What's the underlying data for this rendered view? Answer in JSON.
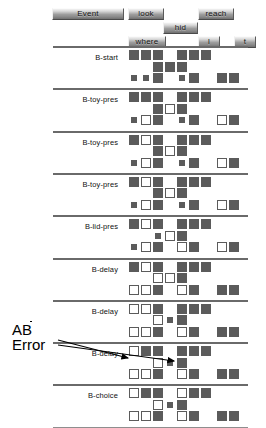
{
  "toolbar": {
    "buttons": [
      {
        "label": "Event",
        "x": 52,
        "y": 8,
        "w": 72,
        "h": 12
      },
      {
        "label": "look",
        "x": 128,
        "y": 8,
        "w": 36,
        "h": 12
      },
      {
        "label": "reach",
        "x": 198,
        "y": 8,
        "w": 36,
        "h": 12
      },
      {
        "label": "hid",
        "x": 163,
        "y": 22,
        "w": 35,
        "h": 12
      },
      {
        "label": "where",
        "x": 128,
        "y": 36,
        "w": 38,
        "h": 12
      },
      {
        "label": "l",
        "x": 198,
        "y": 36,
        "w": 22,
        "h": 12
      },
      {
        "label": "t",
        "x": 234,
        "y": 36,
        "w": 22,
        "h": 12
      }
    ]
  },
  "annotation": {
    "line1_prefix": "A",
    "line1_overbar": "B",
    "line2": "Error"
  },
  "chart_data": {
    "type": "heatmap",
    "title": "",
    "xlabel": "",
    "ylabel": "",
    "legend": [
      "filled = dark square",
      "open = white square",
      "dot = white dot in dark square"
    ],
    "columns": 10,
    "cell_states": [
      "filled",
      "open",
      "dot",
      "empty"
    ],
    "blocks": [
      {
        "label": "B-start",
        "rows": [
          {
            "y": 0,
            "cells": [
              {
                "c": 0,
                "s": "filled"
              },
              {
                "c": 1,
                "s": "filled"
              },
              {
                "c": 2,
                "s": "filled"
              },
              {
                "c": 4,
                "s": "filled"
              },
              {
                "c": 5,
                "s": "filled"
              },
              {
                "c": 6,
                "s": "filled"
              }
            ]
          },
          {
            "y": 1,
            "cells": [
              {
                "c": 2,
                "s": "filled"
              },
              {
                "c": 3,
                "s": "filled"
              },
              {
                "c": 4,
                "s": "filled"
              }
            ]
          },
          {
            "y": 2,
            "cells": [
              {
                "c": 0,
                "s": "dot"
              },
              {
                "c": 1,
                "s": "dot"
              },
              {
                "c": 2,
                "s": "filled"
              },
              {
                "c": 4,
                "s": "dot"
              },
              {
                "c": 5,
                "s": "filled"
              },
              {
                "c": 7,
                "s": "filled"
              },
              {
                "c": 8,
                "s": "filled"
              }
            ]
          }
        ]
      },
      {
        "label": "B-toy-pres",
        "rows": [
          {
            "y": 0,
            "cells": [
              {
                "c": 0,
                "s": "filled"
              },
              {
                "c": 1,
                "s": "filled"
              },
              {
                "c": 2,
                "s": "filled"
              },
              {
                "c": 4,
                "s": "filled"
              },
              {
                "c": 5,
                "s": "filled"
              },
              {
                "c": 6,
                "s": "filled"
              }
            ]
          },
          {
            "y": 1,
            "cells": [
              {
                "c": 2,
                "s": "filled"
              },
              {
                "c": 3,
                "s": "open"
              },
              {
                "c": 4,
                "s": "filled"
              }
            ]
          },
          {
            "y": 2,
            "cells": [
              {
                "c": 0,
                "s": "dot"
              },
              {
                "c": 1,
                "s": "open"
              },
              {
                "c": 2,
                "s": "filled"
              },
              {
                "c": 4,
                "s": "dot"
              },
              {
                "c": 5,
                "s": "filled"
              },
              {
                "c": 7,
                "s": "open"
              },
              {
                "c": 8,
                "s": "filled"
              }
            ]
          }
        ]
      },
      {
        "label": "B-toy-pres",
        "rows": [
          {
            "y": 0,
            "cells": [
              {
                "c": 0,
                "s": "filled"
              },
              {
                "c": 1,
                "s": "open"
              },
              {
                "c": 2,
                "s": "filled"
              },
              {
                "c": 4,
                "s": "filled"
              },
              {
                "c": 5,
                "s": "filled"
              },
              {
                "c": 6,
                "s": "filled"
              }
            ]
          },
          {
            "y": 1,
            "cells": [
              {
                "c": 2,
                "s": "filled"
              },
              {
                "c": 3,
                "s": "open"
              },
              {
                "c": 4,
                "s": "filled"
              }
            ]
          },
          {
            "y": 2,
            "cells": [
              {
                "c": 0,
                "s": "dot"
              },
              {
                "c": 1,
                "s": "open"
              },
              {
                "c": 2,
                "s": "filled"
              },
              {
                "c": 4,
                "s": "dot"
              },
              {
                "c": 5,
                "s": "filled"
              },
              {
                "c": 7,
                "s": "open"
              },
              {
                "c": 8,
                "s": "filled"
              }
            ]
          }
        ]
      },
      {
        "label": "B-toy-pres",
        "rows": [
          {
            "y": 0,
            "cells": [
              {
                "c": 0,
                "s": "filled"
              },
              {
                "c": 1,
                "s": "open"
              },
              {
                "c": 2,
                "s": "filled"
              },
              {
                "c": 4,
                "s": "filled"
              },
              {
                "c": 5,
                "s": "filled"
              },
              {
                "c": 6,
                "s": "filled"
              }
            ]
          },
          {
            "y": 1,
            "cells": [
              {
                "c": 2,
                "s": "filled"
              },
              {
                "c": 3,
                "s": "open"
              },
              {
                "c": 4,
                "s": "filled"
              }
            ]
          },
          {
            "y": 2,
            "cells": [
              {
                "c": 0,
                "s": "dot"
              },
              {
                "c": 1,
                "s": "open"
              },
              {
                "c": 2,
                "s": "filled"
              },
              {
                "c": 4,
                "s": "dot"
              },
              {
                "c": 5,
                "s": "filled"
              },
              {
                "c": 7,
                "s": "open"
              },
              {
                "c": 8,
                "s": "filled"
              }
            ]
          }
        ]
      },
      {
        "label": "B-lid-pres",
        "rows": [
          {
            "y": 0,
            "cells": [
              {
                "c": 0,
                "s": "filled"
              },
              {
                "c": 1,
                "s": "open"
              },
              {
                "c": 2,
                "s": "filled"
              },
              {
                "c": 4,
                "s": "filled"
              },
              {
                "c": 5,
                "s": "filled"
              },
              {
                "c": 6,
                "s": "filled"
              }
            ]
          },
          {
            "y": 1,
            "cells": [
              {
                "c": 2,
                "s": "dot"
              },
              {
                "c": 3,
                "s": "open"
              },
              {
                "c": 4,
                "s": "filled"
              }
            ]
          },
          {
            "y": 2,
            "cells": [
              {
                "c": 0,
                "s": "dot"
              },
              {
                "c": 1,
                "s": "open"
              },
              {
                "c": 2,
                "s": "filled"
              },
              {
                "c": 4,
                "s": "open"
              },
              {
                "c": 5,
                "s": "filled"
              },
              {
                "c": 7,
                "s": "open"
              },
              {
                "c": 8,
                "s": "filled"
              }
            ]
          }
        ]
      },
      {
        "label": "B-delay",
        "rows": [
          {
            "y": 0,
            "cells": [
              {
                "c": 0,
                "s": "filled"
              },
              {
                "c": 1,
                "s": "open"
              },
              {
                "c": 2,
                "s": "filled"
              },
              {
                "c": 4,
                "s": "filled"
              },
              {
                "c": 5,
                "s": "filled"
              },
              {
                "c": 6,
                "s": "filled"
              }
            ]
          },
          {
            "y": 1,
            "cells": [
              {
                "c": 2,
                "s": "open"
              },
              {
                "c": 3,
                "s": "open"
              },
              {
                "c": 4,
                "s": "filled"
              }
            ]
          },
          {
            "y": 2,
            "cells": [
              {
                "c": 0,
                "s": "open"
              },
              {
                "c": 1,
                "s": "open"
              },
              {
                "c": 2,
                "s": "filled"
              },
              {
                "c": 4,
                "s": "open"
              },
              {
                "c": 5,
                "s": "filled"
              },
              {
                "c": 7,
                "s": "filled"
              },
              {
                "c": 8,
                "s": "filled"
              }
            ]
          }
        ]
      },
      {
        "label": "B-delay",
        "rows": [
          {
            "y": 0,
            "cells": [
              {
                "c": 0,
                "s": "open"
              },
              {
                "c": 1,
                "s": "open"
              },
              {
                "c": 2,
                "s": "filled"
              },
              {
                "c": 4,
                "s": "filled"
              },
              {
                "c": 5,
                "s": "filled"
              },
              {
                "c": 6,
                "s": "filled"
              }
            ]
          },
          {
            "y": 1,
            "cells": [
              {
                "c": 2,
                "s": "open"
              },
              {
                "c": 3,
                "s": "dot"
              },
              {
                "c": 4,
                "s": "filled"
              }
            ]
          },
          {
            "y": 2,
            "cells": [
              {
                "c": 0,
                "s": "open"
              },
              {
                "c": 1,
                "s": "open"
              },
              {
                "c": 2,
                "s": "filled"
              },
              {
                "c": 4,
                "s": "open"
              },
              {
                "c": 5,
                "s": "filled"
              },
              {
                "c": 7,
                "s": "filled"
              },
              {
                "c": 8,
                "s": "filled"
              }
            ]
          }
        ]
      },
      {
        "label": "B-delay",
        "rows": [
          {
            "y": 0,
            "cells": [
              {
                "c": 0,
                "s": "open"
              },
              {
                "c": 1,
                "s": "filled"
              },
              {
                "c": 2,
                "s": "filled"
              },
              {
                "c": 4,
                "s": "filled"
              },
              {
                "c": 5,
                "s": "filled"
              },
              {
                "c": 6,
                "s": "filled"
              }
            ]
          },
          {
            "y": 1,
            "cells": [
              {
                "c": 2,
                "s": "open"
              },
              {
                "c": 3,
                "s": "dot"
              },
              {
                "c": 4,
                "s": "filled"
              }
            ]
          },
          {
            "y": 2,
            "cells": [
              {
                "c": 0,
                "s": "open"
              },
              {
                "c": 1,
                "s": "open"
              },
              {
                "c": 2,
                "s": "filled"
              },
              {
                "c": 4,
                "s": "open"
              },
              {
                "c": 5,
                "s": "filled"
              },
              {
                "c": 7,
                "s": "filled"
              },
              {
                "c": 8,
                "s": "filled"
              }
            ]
          }
        ]
      },
      {
        "label": "B-choice",
        "rows": [
          {
            "y": 0,
            "cells": [
              {
                "c": 0,
                "s": "open"
              },
              {
                "c": 1,
                "s": "filled"
              },
              {
                "c": 2,
                "s": "filled"
              },
              {
                "c": 4,
                "s": "open"
              },
              {
                "c": 5,
                "s": "filled"
              },
              {
                "c": 6,
                "s": "filled"
              }
            ]
          },
          {
            "y": 1,
            "cells": [
              {
                "c": 2,
                "s": "open"
              },
              {
                "c": 3,
                "s": "dot"
              },
              {
                "c": 4,
                "s": "filled"
              }
            ]
          },
          {
            "y": 2,
            "cells": [
              {
                "c": 0,
                "s": "open"
              },
              {
                "c": 1,
                "s": "open"
              },
              {
                "c": 2,
                "s": "filled"
              },
              {
                "c": 4,
                "s": "open"
              },
              {
                "c": 5,
                "s": "filled"
              },
              {
                "c": 7,
                "s": "filled"
              },
              {
                "c": 8,
                "s": "filled"
              }
            ]
          }
        ]
      }
    ]
  }
}
